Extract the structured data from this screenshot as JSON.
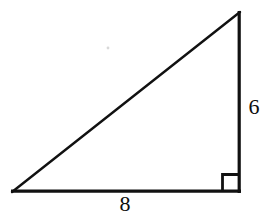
{
  "figure": {
    "kind": "right-triangle-diagram",
    "background_color": "#ffffff",
    "stroke_color": "#111111",
    "label_color": "#0d0d0d",
    "canvas": {
      "width": 268,
      "height": 216
    },
    "vertices": {
      "bottom_left": {
        "x": 12,
        "y": 192
      },
      "bottom_right": {
        "x": 240,
        "y": 192
      },
      "top_right": {
        "x": 240,
        "y": 12
      }
    },
    "sides": [
      {
        "name": "horizontal-leg",
        "label": "8",
        "from": "bottom_left",
        "to": "bottom_right",
        "stroke_width": 3.2
      },
      {
        "name": "vertical-leg",
        "label": "6",
        "from": "bottom_right",
        "to": "top_right",
        "stroke_width": 3.2
      },
      {
        "name": "hypotenuse",
        "label": "",
        "from": "bottom_left",
        "to": "top_right",
        "stroke_width": 2.4
      }
    ],
    "right_angle_marker": {
      "name": "right-angle-square",
      "at_vertex": "bottom_right",
      "size": 17,
      "stroke_width": 2.8
    },
    "speck": {
      "x": 108,
      "y": 48,
      "radius": 1.4,
      "color": "#d8d8d8"
    }
  },
  "labels": {
    "vertical_leg": "6",
    "horizontal_leg": "8"
  }
}
